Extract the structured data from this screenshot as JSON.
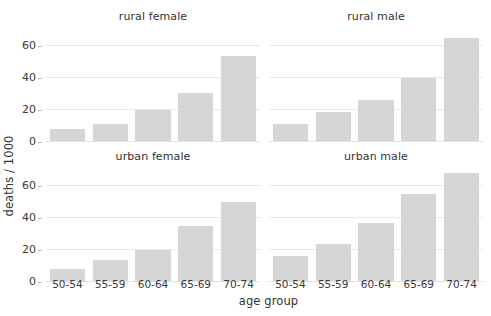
{
  "chart_data": {
    "type": "bar",
    "title": "",
    "subtitle": "",
    "xlabel": "age group",
    "ylabel": "deaths / 1000",
    "categories": [
      "50-54",
      "55-59",
      "60-64",
      "65-69",
      "70-74"
    ],
    "ylim": [
      0,
      72
    ],
    "yticks": [
      0,
      20,
      40,
      60
    ],
    "ytick_labels": [
      "0",
      "20",
      "40",
      "60"
    ],
    "grid": "horizontal",
    "legend": "none",
    "facet_layout": {
      "rows": 2,
      "cols": 2
    },
    "bar_color": "#d6d6d6",
    "gridline_color": "#e8e8e8",
    "text_color": "#333333",
    "background": "#ffffff",
    "panels": [
      {
        "title": "rural female",
        "row": 0,
        "col": 0,
        "categories": [
          "50-54",
          "55-59",
          "60-64",
          "65-69",
          "70-74"
        ],
        "values": [
          8,
          11,
          20,
          31,
          54
        ]
      },
      {
        "title": "rural male",
        "row": 0,
        "col": 1,
        "categories": [
          "50-54",
          "55-59",
          "60-64",
          "65-69",
          "70-74"
        ],
        "values": [
          11,
          19,
          26,
          40,
          65
        ]
      },
      {
        "title": "urban female",
        "row": 1,
        "col": 0,
        "categories": [
          "50-54",
          "55-59",
          "60-64",
          "65-69",
          "70-74"
        ],
        "values": [
          8,
          14,
          20,
          35,
          50
        ]
      },
      {
        "title": "urban male",
        "row": 1,
        "col": 1,
        "categories": [
          "50-54",
          "55-59",
          "60-64",
          "65-69",
          "70-74"
        ],
        "values": [
          16,
          24,
          37,
          55,
          68
        ]
      }
    ]
  }
}
